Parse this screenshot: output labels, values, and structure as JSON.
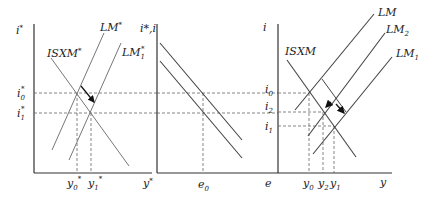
{
  "diagram": {
    "panels": [
      {
        "name": "foreign-economy",
        "y_axis_label": "i*",
        "x_axis_label": "y*",
        "curves": [
          "ISXM*",
          "LM*",
          "LM1*"
        ],
        "y_ticks": [
          "i0*",
          "i1*"
        ],
        "x_ticks": [
          "y0*",
          "y1*"
        ]
      },
      {
        "name": "exchange-rate",
        "y_axis_label": "i*,i",
        "x_axis_label": "e",
        "x_ticks": [
          "e0"
        ]
      },
      {
        "name": "home-economy",
        "y_axis_label": "i",
        "x_axis_label": "y",
        "curves": [
          "ISXM",
          "LM",
          "LM2",
          "LM1"
        ],
        "y_ticks": [
          "i0",
          "i2",
          "i1"
        ],
        "x_ticks": [
          "y0",
          "y2",
          "y1"
        ]
      }
    ]
  },
  "labels": {
    "p1_yaxis": "i",
    "p1_yaxis_sup": "*",
    "p1_xaxis": "y",
    "p1_xaxis_sup": "*",
    "isxm_star": "ISXM",
    "isxm_star_sup": "*",
    "lm_star": "LM",
    "lm_star_sup": "*",
    "lm1_star": "LM",
    "lm1_star_sub": "1",
    "lm1_star_sup": "*",
    "i0_star": "i",
    "i0_star_sub": "0",
    "i0_star_sup": "*",
    "i1_star": "i",
    "i1_star_sub": "1",
    "i1_star_sup": "*",
    "y0_star": "y",
    "y0_star_sub": "0",
    "y0_star_sup": "*",
    "y1_star": "y",
    "y1_star_sub": "1",
    "y1_star_sup": "*",
    "p2_yaxis": "i*,i",
    "p2_xaxis": "e",
    "e0": "e",
    "e0_sub": "0",
    "p3_yaxis": "i",
    "p3_xaxis": "y",
    "isxm": "ISXM",
    "lm": "LM",
    "lm2": "LM",
    "lm2_sub": "2",
    "lm1": "LM",
    "lm1_sub": "1",
    "i0": "i",
    "i0_sub": "0",
    "i2": "i",
    "i2_sub": "2",
    "i1": "i",
    "i1_sub": "1",
    "y0": "y",
    "y0_sub": "0",
    "y2": "y",
    "y2_sub": "2",
    "y1": "y",
    "y1_sub": "1"
  }
}
